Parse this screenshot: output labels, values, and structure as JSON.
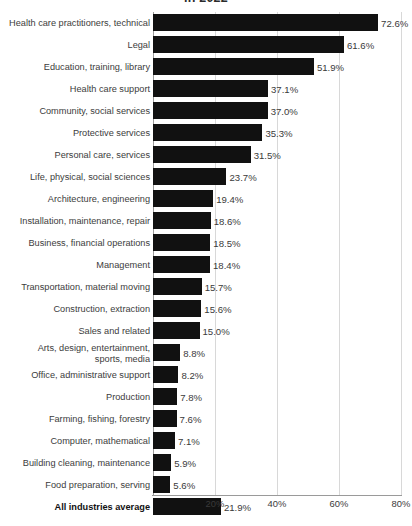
{
  "chart_data": {
    "type": "bar",
    "orientation": "horizontal",
    "title": "in 2022",
    "xlabel": "",
    "ylabel": "",
    "xlim": [
      0,
      85
    ],
    "grid": true,
    "grid_axis": "x",
    "legend": "none",
    "value_suffix": "%",
    "xticks": [
      "20%",
      "40%",
      "60%",
      "80%"
    ],
    "xtick_values": [
      20,
      40,
      60,
      80
    ],
    "categories": [
      "Health care practitioners, technical",
      "Legal",
      "Education, training, library",
      "Health care support",
      "Community, social services",
      "Protective services",
      "Personal care, services",
      "Life, physical, social sciences",
      "Architecture, engineering",
      "Installation, maintenance, repair",
      "Business, financial operations",
      "Management",
      "Transportation, material moving",
      "Construction, extraction",
      "Sales and related",
      "Arts, design, entertainment,\nsports, media",
      "Office, administrative support",
      "Production",
      "Farming, fishing, forestry",
      "Computer, mathematical",
      "Building cleaning, maintenance",
      "Food preparation, serving",
      "All industries average"
    ],
    "values": [
      72.6,
      61.6,
      51.9,
      37.1,
      37.0,
      35.3,
      31.5,
      23.7,
      19.4,
      18.6,
      18.5,
      18.4,
      15.7,
      15.6,
      15.0,
      8.8,
      8.2,
      7.8,
      7.6,
      7.1,
      5.9,
      5.6,
      21.9
    ],
    "value_labels": [
      "72.6%",
      "61.6%",
      "51.9%",
      "37.1%",
      "37.0%",
      "35.3%",
      "31.5%",
      "23.7%",
      "19.4%",
      "18.6%",
      "18.5%",
      "18.4%",
      "15.7%",
      "15.6%",
      "15.0%",
      "8.8%",
      "8.2%",
      "7.8%",
      "7.6%",
      "7.1%",
      "5.9%",
      "5.6%",
      "21.9%"
    ],
    "emphasis_index": 22,
    "bar_color": "#111111",
    "gridline_color": "#d8d8d8",
    "axis_color": "#9a9a9a",
    "text_color": "#3a3a3a"
  }
}
